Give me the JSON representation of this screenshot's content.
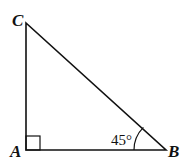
{
  "diagram": {
    "type": "right-triangle",
    "vertices": [
      {
        "id": "A",
        "label": "A",
        "x": 26,
        "y": 150
      },
      {
        "id": "B",
        "label": "B",
        "x": 166,
        "y": 150
      },
      {
        "id": "C",
        "label": "C",
        "x": 26,
        "y": 23
      }
    ],
    "right_angle_at": "A",
    "angle_marks": [
      {
        "vertex": "B",
        "label": "45°"
      }
    ],
    "stroke_color": "#111111"
  }
}
